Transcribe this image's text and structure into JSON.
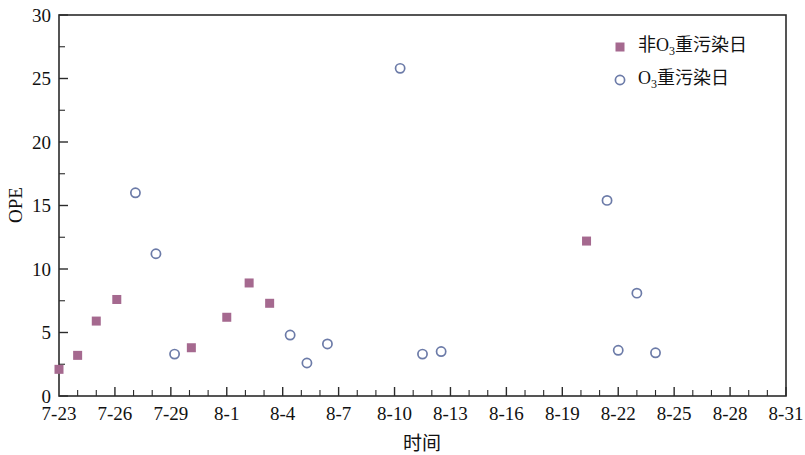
{
  "chart_data": {
    "type": "scatter",
    "title": "",
    "xlabel": "时间",
    "ylabel": "OPE",
    "ylim": [
      0,
      30
    ],
    "yticks": [
      0,
      5,
      10,
      15,
      20,
      25,
      30
    ],
    "yminor_step": 2.5,
    "xlim": [
      "7-23",
      "8-31"
    ],
    "xticks": [
      "7-23",
      "7-26",
      "7-29",
      "8-1",
      "8-4",
      "8-7",
      "8-10",
      "8-13",
      "8-16",
      "8-19",
      "8-22",
      "8-25",
      "8-28",
      "8-31"
    ],
    "xminor_per_major": 3,
    "grid": false,
    "legend_position": "top-right",
    "colors": {
      "non_ozone_marker": "#a5698f",
      "ozone_marker": "#6c7ba8",
      "axis": "#2b2b2b",
      "text": "#111111",
      "background": "#ffffff"
    },
    "series": [
      {
        "name": "非O3重污染日",
        "name_parts": {
          "prefix": "非O",
          "sub": "3",
          "suffix": "重污染日"
        },
        "marker": "square",
        "color": "#a5698f",
        "points": [
          {
            "x": "7-23",
            "x_index": 0.0,
            "y": 2.1
          },
          {
            "x": "7-24",
            "x_index": 1.0,
            "y": 3.2
          },
          {
            "x": "7-25",
            "x_index": 2.0,
            "y": 5.9
          },
          {
            "x": "7-26",
            "x_index": 3.1,
            "y": 7.6
          },
          {
            "x": "7-30",
            "x_index": 7.1,
            "y": 3.8
          },
          {
            "x": "8-1",
            "x_index": 9.0,
            "y": 6.2
          },
          {
            "x": "8-2",
            "x_index": 10.2,
            "y": 8.9
          },
          {
            "x": "8-3",
            "x_index": 11.3,
            "y": 7.3
          },
          {
            "x": "8-20",
            "x_index": 28.3,
            "y": 12.2
          }
        ]
      },
      {
        "name": "O3重污染日",
        "name_parts": {
          "prefix": "O",
          "sub": "3",
          "suffix": "重污染日"
        },
        "marker": "circle",
        "color": "#6c7ba8",
        "points": [
          {
            "x": "7-27",
            "x_index": 4.1,
            "y": 16.0
          },
          {
            "x": "7-28",
            "x_index": 5.2,
            "y": 11.2
          },
          {
            "x": "7-29",
            "x_index": 6.2,
            "y": 3.3
          },
          {
            "x": "8-3",
            "x_index": 12.4,
            "y": 4.8
          },
          {
            "x": "8-4",
            "x_index": 13.3,
            "y": 2.6
          },
          {
            "x": "8-5",
            "x_index": 14.4,
            "y": 4.1
          },
          {
            "x": "8-9",
            "x_index": 18.3,
            "y": 25.8
          },
          {
            "x": "8-10",
            "x_index": 19.5,
            "y": 3.3
          },
          {
            "x": "8-11",
            "x_index": 20.5,
            "y": 3.5
          },
          {
            "x": "8-21",
            "x_index": 29.4,
            "y": 15.4
          },
          {
            "x": "8-22",
            "x_index": 31.0,
            "y": 8.1
          },
          {
            "x": "8-22b",
            "x_index": 30.0,
            "y": 3.6
          },
          {
            "x": "8-24",
            "x_index": 32.0,
            "y": 3.4
          }
        ]
      }
    ]
  },
  "legend": {
    "entries": [
      {
        "marker": "square",
        "color": "#a5698f",
        "prefix": "非O",
        "sub": "3",
        "suffix": "重污染日"
      },
      {
        "marker": "circle",
        "color": "#6c7ba8",
        "prefix": "O",
        "sub": "3",
        "suffix": "重污染日"
      }
    ]
  },
  "axes": {
    "y_title": "OPE",
    "x_title": "时间"
  }
}
